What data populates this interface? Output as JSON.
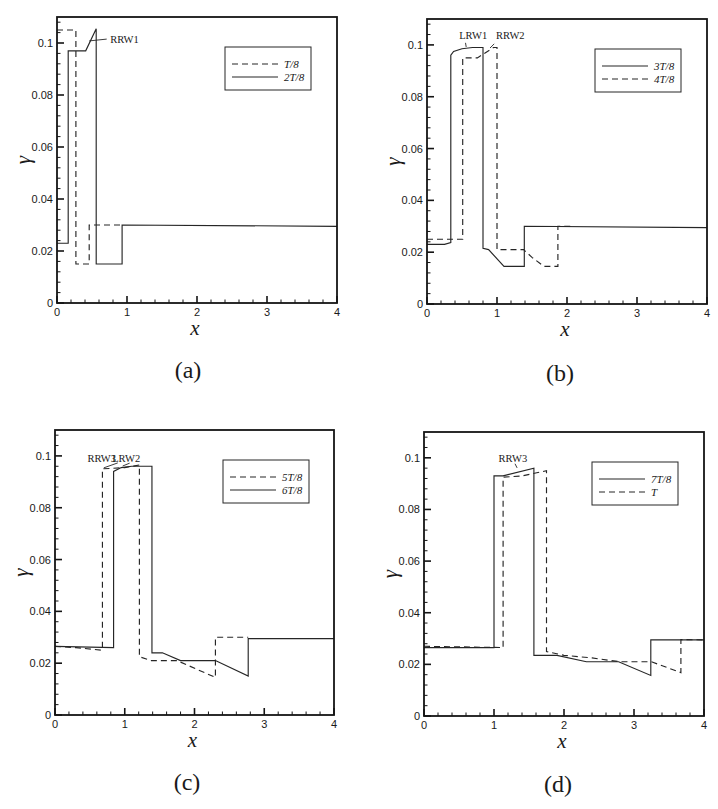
{
  "chart_data": [
    {
      "type": "line",
      "panel_label": "(a)",
      "title": "",
      "xlabel": "x",
      "ylabel": "γ",
      "xlim": [
        0,
        4
      ],
      "ylim": [
        0,
        0.11
      ],
      "xticks": [
        0,
        1,
        2,
        3,
        4
      ],
      "xtick_labels": [
        "0",
        "1",
        "2",
        "3",
        "4"
      ],
      "yticks": [
        0,
        0.02,
        0.04,
        0.06,
        0.08,
        0.1
      ],
      "ytick_labels": [
        "0",
        "0.02",
        "0.04",
        "0.06",
        "0.08",
        "0.1"
      ],
      "grid": false,
      "legend_position": "upper right",
      "series": [
        {
          "name": "T/8",
          "style": "dashed",
          "points": [
            [
              0,
              0.105
            ],
            [
              0.27,
              0.105
            ],
            [
              0.27,
              0.015
            ],
            [
              0.46,
              0.015
            ],
            [
              0.46,
              0.03
            ],
            [
              0.93,
              0.03
            ]
          ]
        },
        {
          "name": "2T/8",
          "style": "solid",
          "points": [
            [
              0,
              0.023
            ],
            [
              0.16,
              0.023
            ],
            [
              0.16,
              0.097
            ],
            [
              0.41,
              0.097
            ],
            [
              0.56,
              0.1055
            ],
            [
              0.56,
              0.015
            ],
            [
              0.93,
              0.015
            ],
            [
              0.93,
              0.03
            ],
            [
              4,
              0.0295
            ]
          ]
        }
      ],
      "annotations": [
        {
          "text": "RRW1",
          "x": 0.76,
          "y": 0.1,
          "anchor": "start",
          "pointer": [
            [
              0.46,
              0.1008
            ],
            [
              0.71,
              0.1015
            ]
          ]
        }
      ]
    },
    {
      "type": "line",
      "panel_label": "(b)",
      "title": "",
      "xlabel": "x",
      "ylabel": "γ",
      "xlim": [
        0,
        4
      ],
      "ylim": [
        0,
        0.11
      ],
      "xticks": [
        0,
        1,
        2,
        3,
        4
      ],
      "xtick_labels": [
        "0",
        "1",
        "2",
        "3",
        "4"
      ],
      "yticks": [
        0,
        0.02,
        0.04,
        0.06,
        0.08,
        0.1
      ],
      "ytick_labels": [
        "0",
        "0.02",
        "0.04",
        "0.06",
        "0.08",
        "0.1"
      ],
      "grid": false,
      "legend_position": "upper right",
      "series": [
        {
          "name": "3T/8",
          "style": "solid",
          "points": [
            [
              0,
              0.023
            ],
            [
              0.25,
              0.023
            ],
            [
              0.34,
              0.0237
            ],
            [
              0.34,
              0.096
            ],
            [
              0.38,
              0.0975
            ],
            [
              0.5,
              0.0985
            ],
            [
              0.65,
              0.099
            ],
            [
              0.8,
              0.099
            ],
            [
              0.8,
              0.0215
            ],
            [
              0.88,
              0.021
            ],
            [
              1.1,
              0.0145
            ],
            [
              1.39,
              0.0145
            ],
            [
              1.39,
              0.03
            ],
            [
              4,
              0.0295
            ]
          ]
        },
        {
          "name": "4T/8",
          "style": "dashed",
          "points": [
            [
              0,
              0.025
            ],
            [
              0.51,
              0.025
            ],
            [
              0.51,
              0.095
            ],
            [
              0.72,
              0.095
            ],
            [
              0.95,
              0.099
            ],
            [
              1.0,
              0.099
            ],
            [
              1.0,
              0.021
            ],
            [
              1.38,
              0.021
            ],
            [
              1.5,
              0.018
            ],
            [
              1.67,
              0.0145
            ],
            [
              1.87,
              0.0145
            ],
            [
              1.87,
              0.03
            ],
            [
              2.1,
              0.03
            ]
          ]
        }
      ],
      "annotations": [
        {
          "text": "LRW1",
          "x": 0.66,
          "y": 0.1023,
          "anchor": "middle",
          "pointer": [
            [
              0.55,
              0.1008
            ],
            [
              0.56,
              0.0992
            ]
          ]
        },
        {
          "text": "RRW2",
          "x": 1.19,
          "y": 0.1023,
          "anchor": "middle",
          "pointer": [
            [
              0.9,
              0.0988
            ],
            [
              0.96,
              0.1004
            ]
          ]
        }
      ]
    },
    {
      "type": "line",
      "panel_label": "(c)",
      "title": "",
      "xlabel": "x",
      "ylabel": "γ",
      "xlim": [
        0,
        4
      ],
      "ylim": [
        0,
        0.11
      ],
      "xticks": [
        0,
        1,
        2,
        3,
        4
      ],
      "xtick_labels": [
        "0",
        "1",
        "2",
        "3",
        "4"
      ],
      "yticks": [
        0,
        0.02,
        0.04,
        0.06,
        0.08,
        0.1
      ],
      "ytick_labels": [
        "0",
        "0.02",
        "0.04",
        "0.06",
        "0.08",
        "0.1"
      ],
      "grid": false,
      "legend_position": "upper right",
      "series": [
        {
          "name": "5T/8",
          "style": "dashed",
          "points": [
            [
              0,
              0.0265
            ],
            [
              0.3,
              0.026
            ],
            [
              0.68,
              0.025
            ],
            [
              0.68,
              0.095
            ],
            [
              1.0,
              0.0955
            ],
            [
              1.21,
              0.0965
            ],
            [
              1.21,
              0.0225
            ],
            [
              1.38,
              0.021
            ],
            [
              1.75,
              0.021
            ],
            [
              2.3,
              0.0145
            ],
            [
              2.3,
              0.03
            ],
            [
              2.77,
              0.03
            ]
          ]
        },
        {
          "name": "6T/8",
          "style": "solid",
          "points": [
            [
              0,
              0.0265
            ],
            [
              0.84,
              0.026
            ],
            [
              0.84,
              0.094
            ],
            [
              0.95,
              0.0955
            ],
            [
              1.1,
              0.096
            ],
            [
              1.39,
              0.096
            ],
            [
              1.39,
              0.024
            ],
            [
              1.54,
              0.024
            ],
            [
              1.8,
              0.021
            ],
            [
              2.3,
              0.021
            ],
            [
              2.77,
              0.015
            ],
            [
              2.77,
              0.0295
            ],
            [
              4,
              0.0295
            ]
          ]
        }
      ],
      "annotations": [
        {
          "text": "RRW3",
          "x": 0.67,
          "y": 0.0977,
          "anchor": "middle",
          "pointer": [
            [
              0.7,
              0.0954
            ],
            [
              0.9,
              0.0973
            ]
          ]
        },
        {
          "text": "LRW2",
          "x": 1.02,
          "y": 0.0977,
          "anchor": "middle",
          "pointer": [
            [
              0.97,
              0.0961
            ],
            [
              1.07,
              0.0972
            ]
          ]
        }
      ]
    },
    {
      "type": "line",
      "panel_label": "(d)",
      "title": "",
      "xlabel": "x",
      "ylabel": "γ",
      "xlim": [
        0,
        4
      ],
      "ylim": [
        0,
        0.11
      ],
      "xticks": [
        0,
        1,
        2,
        3,
        4
      ],
      "xtick_labels": [
        "0",
        "1",
        "2",
        "3",
        "4"
      ],
      "yticks": [
        0,
        0.02,
        0.04,
        0.06,
        0.08,
        0.1
      ],
      "ytick_labels": [
        "0",
        "0.02",
        "0.04",
        "0.06",
        "0.08",
        "0.1"
      ],
      "grid": false,
      "legend_position": "upper right",
      "series": [
        {
          "name": "7T/8",
          "style": "solid",
          "points": [
            [
              0,
              0.0265
            ],
            [
              1.0,
              0.0265
            ],
            [
              1.0,
              0.093
            ],
            [
              1.13,
              0.093
            ],
            [
              1.57,
              0.096
            ],
            [
              1.57,
              0.0235
            ],
            [
              1.9,
              0.0235
            ],
            [
              2.32,
              0.021
            ],
            [
              2.78,
              0.021
            ],
            [
              3.24,
              0.0157
            ],
            [
              3.24,
              0.0295
            ],
            [
              4,
              0.0295
            ]
          ]
        },
        {
          "name": "T",
          "style": "dashed",
          "points": [
            [
              0,
              0.027
            ],
            [
              1.13,
              0.0265
            ],
            [
              1.13,
              0.0925
            ],
            [
              1.4,
              0.093
            ],
            [
              1.75,
              0.095
            ],
            [
              1.75,
              0.025
            ],
            [
              2.0,
              0.0235
            ],
            [
              2.4,
              0.0225
            ],
            [
              2.8,
              0.021
            ],
            [
              3.25,
              0.021
            ],
            [
              3.67,
              0.0168
            ],
            [
              3.67,
              0.0296
            ],
            [
              4,
              0.0295
            ]
          ]
        }
      ],
      "annotations": [
        {
          "text": "RRW3",
          "x": 1.27,
          "y": 0.0985,
          "anchor": "middle",
          "pointer": [
            [
              1.3,
              0.0977
            ],
            [
              1.33,
              0.0961
            ]
          ]
        }
      ]
    }
  ]
}
